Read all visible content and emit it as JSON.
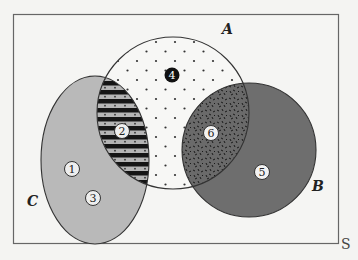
{
  "diagram": {
    "type": "venn",
    "universe": {
      "label": "S"
    },
    "sets": [
      {
        "label": "A",
        "shape": "circle",
        "fill": "dotted"
      },
      {
        "label": "B",
        "shape": "circle",
        "fill": "#6e6e6e"
      },
      {
        "label": "C",
        "shape": "ellipse",
        "fill": "#b9b9b9"
      }
    ],
    "regions": [
      {
        "number": "1",
        "description": "C only",
        "fill": "#b9b9b9"
      },
      {
        "number": "2",
        "description": "A ∩ C",
        "fill": "striped"
      },
      {
        "number": "3",
        "description": "C only",
        "fill": "#b9b9b9"
      },
      {
        "number": "4",
        "description": "A only",
        "fill": "dotted"
      },
      {
        "number": "5",
        "description": "B only",
        "fill": "#6e6e6e"
      },
      {
        "number": "6",
        "description": "A ∩ B",
        "fill": "speckled"
      }
    ],
    "colors": {
      "background": "#f4f4f2",
      "c_fill": "#b9b9b9",
      "b_fill": "#6e6e6e",
      "stroke": "#333333"
    }
  }
}
